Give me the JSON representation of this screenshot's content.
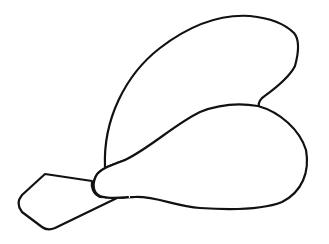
{
  "drawing": {
    "subject": "line drawing of two rounded lobes with a stem and angular tip",
    "background": "#ffffff",
    "stroke_color": "#111111",
    "parts": [
      "upper-lobe",
      "lower-lobe",
      "stem-knob",
      "tip"
    ]
  }
}
